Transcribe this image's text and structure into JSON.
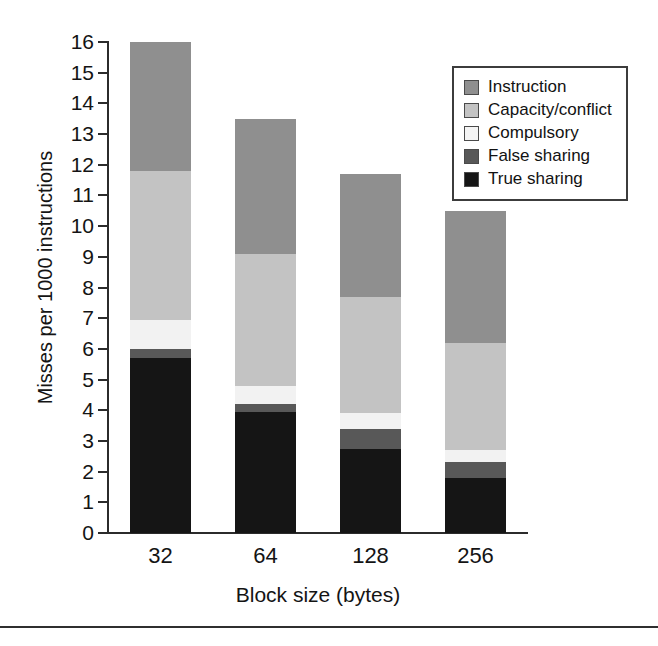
{
  "figure": {
    "background": "#ffffff",
    "bottom_rule": true
  },
  "chart_data": {
    "type": "bar",
    "stacked": true,
    "title": "",
    "xlabel": "Block size (bytes)",
    "ylabel": "Misses per 1000 instructions",
    "categories": [
      "32",
      "64",
      "128",
      "256"
    ],
    "ylim": [
      0,
      16
    ],
    "yticks": [
      0,
      1,
      2,
      3,
      4,
      5,
      6,
      7,
      8,
      9,
      10,
      11,
      12,
      13,
      14,
      15,
      16
    ],
    "ytick_labels": [
      "0",
      "1",
      "2",
      "3",
      "4",
      "5",
      "6",
      "7",
      "8",
      "9",
      "10",
      "11",
      "12",
      "13",
      "14",
      "15",
      "16"
    ],
    "grid": false,
    "legend_position": "upper-right",
    "series": [
      {
        "name": "True sharing",
        "color": "#151515",
        "values": [
          5.7,
          3.95,
          2.75,
          1.8
        ]
      },
      {
        "name": "False sharing",
        "color": "#585858",
        "values": [
          0.3,
          0.25,
          0.65,
          0.5
        ]
      },
      {
        "name": "Compulsory",
        "color": "#f2f2f2",
        "values": [
          0.95,
          0.6,
          0.5,
          0.4
        ]
      },
      {
        "name": "Capacity/conflict",
        "color": "#c3c3c3",
        "values": [
          4.85,
          4.3,
          3.8,
          3.5
        ]
      },
      {
        "name": "Instruction",
        "color": "#8f8f8f",
        "values": [
          4.2,
          4.4,
          4.0,
          4.3
        ]
      }
    ],
    "totals": [
      16.0,
      13.5,
      11.7,
      10.5
    ]
  },
  "legend": {
    "items": [
      {
        "label": "Instruction",
        "color": "#8f8f8f"
      },
      {
        "label": "Capacity/conflict",
        "color": "#c3c3c3"
      },
      {
        "label": "Compulsory",
        "color": "#f4f4f4"
      },
      {
        "label": "False sharing",
        "color": "#585858"
      },
      {
        "label": "True sharing",
        "color": "#151515"
      }
    ]
  }
}
